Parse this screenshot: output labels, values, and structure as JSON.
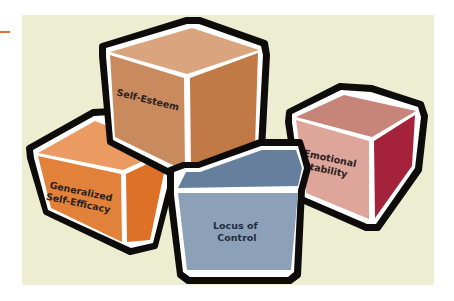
{
  "diagram": {
    "type": "concept-cubes",
    "background_color": "#ededd2",
    "accent_color": "#d9773a",
    "cubes": [
      {
        "id": "generalized-self-efficacy",
        "label_lines": [
          "Generalized",
          "Self-Efficacy"
        ],
        "colors": {
          "top": "#eb9a62",
          "front": "#e2813a",
          "side": "#dd7128"
        }
      },
      {
        "id": "self-esteem",
        "label_lines": [
          "Self-Esteem"
        ],
        "colors": {
          "top": "#d9a47e",
          "front": "#c98a5e",
          "side": "#c17a45"
        }
      },
      {
        "id": "emotional-stability",
        "label_lines": [
          "Emotional",
          "Stability"
        ],
        "colors": {
          "top": "#c78478",
          "front": "#dea59b",
          "side": "#a4233a"
        }
      },
      {
        "id": "locus-of-control",
        "label_lines": [
          "Locus of",
          "Control"
        ],
        "colors": {
          "top": "#667f9c",
          "front": "#8ca0b8",
          "side": "#7d92ab"
        }
      }
    ]
  }
}
